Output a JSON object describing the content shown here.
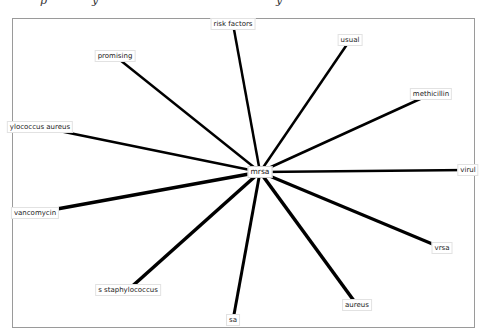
{
  "diagram": {
    "type": "star-network",
    "center": {
      "id": "mrsa",
      "label": "mrsa",
      "x": 260,
      "y": 172
    },
    "nodes": [
      {
        "id": "risk-factors",
        "label": "risk factors",
        "x": 233,
        "y": 24,
        "stroke": 2.5
      },
      {
        "id": "promising",
        "label": "promising",
        "x": 115,
        "y": 56,
        "stroke": 2.5
      },
      {
        "id": "usual",
        "label": "usual",
        "x": 350,
        "y": 40,
        "stroke": 2.5
      },
      {
        "id": "methicillin",
        "label": "methicillin",
        "x": 431,
        "y": 94,
        "stroke": 2.5
      },
      {
        "id": "staphylococcus-aureus",
        "label": "ylococcus aureus",
        "x": 40,
        "y": 127,
        "stroke": 2.5
      },
      {
        "id": "virul",
        "label": "virul",
        "x": 468,
        "y": 170,
        "stroke": 2.5
      },
      {
        "id": "vancomycin",
        "label": "vancomycin",
        "x": 35,
        "y": 213,
        "stroke": 3.5
      },
      {
        "id": "vrsa",
        "label": "vrsa",
        "x": 442,
        "y": 248,
        "stroke": 3
      },
      {
        "id": "s-staphylococcus",
        "label": "s staphylococcus",
        "x": 128,
        "y": 290,
        "stroke": 3.5
      },
      {
        "id": "aureus",
        "label": "aureus",
        "x": 357,
        "y": 305,
        "stroke": 3.5
      },
      {
        "id": "sa",
        "label": "sa",
        "x": 233,
        "y": 320,
        "stroke": 3
      }
    ],
    "colors": {
      "edge": "#000000",
      "frame": "#9a9a9a",
      "background": "#ffffff"
    }
  },
  "header_fragments": [
    "p",
    "y",
    "y"
  ]
}
